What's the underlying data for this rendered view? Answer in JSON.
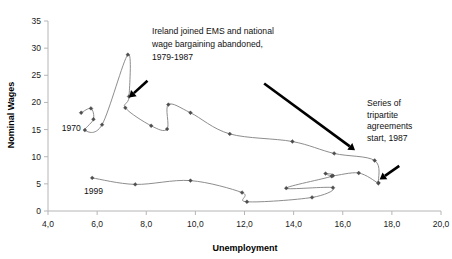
{
  "chart_data": {
    "type": "line",
    "title": "",
    "xlabel": "Unemployment",
    "ylabel": "Nominal Wages",
    "xlim": [
      4.0,
      20.0
    ],
    "ylim": [
      0,
      35
    ],
    "xticks": [
      "4,0",
      "6,0",
      "8,0",
      "10,0",
      "12,0",
      "14,0",
      "16,0",
      "18,0",
      "20,0"
    ],
    "xtick_values": [
      4.0,
      6.0,
      8.0,
      10.0,
      12.0,
      14.0,
      16.0,
      18.0,
      20.0
    ],
    "yticks": [
      "0",
      "5",
      "10",
      "15",
      "20",
      "25",
      "30",
      "35"
    ],
    "ytick_values": [
      0,
      5,
      10,
      15,
      20,
      25,
      30,
      35
    ],
    "grid": false,
    "legend": "none",
    "series": [
      {
        "name": "upper-path-1970-1987",
        "points": [
          [
            5.35,
            18.1
          ],
          [
            5.75,
            18.9
          ],
          [
            5.85,
            16.9
          ],
          [
            5.5,
            14.9
          ],
          [
            6.2,
            15.9
          ],
          [
            7.25,
            28.8
          ],
          [
            7.3,
            21.1
          ],
          [
            7.15,
            19.0
          ],
          [
            8.2,
            15.7
          ],
          [
            8.85,
            15.1
          ],
          [
            8.9,
            19.6
          ],
          [
            9.8,
            18.1
          ],
          [
            11.4,
            14.2
          ],
          [
            13.95,
            12.8
          ],
          [
            15.65,
            10.6
          ],
          [
            17.3,
            9.3
          ],
          [
            17.45,
            5.2
          ]
        ]
      },
      {
        "name": "lower-path-1987-1999",
        "points": [
          [
            17.45,
            5.1
          ],
          [
            16.65,
            7.0
          ],
          [
            15.6,
            6.5
          ],
          [
            15.3,
            6.9
          ],
          [
            15.55,
            6.4
          ],
          [
            13.7,
            4.2
          ],
          [
            15.6,
            4.3
          ],
          [
            14.75,
            2.5
          ],
          [
            12.1,
            1.7
          ],
          [
            11.9,
            3.4
          ],
          [
            9.8,
            5.6
          ],
          [
            7.55,
            4.9
          ],
          [
            5.8,
            6.1
          ]
        ]
      }
    ],
    "annotations": [
      {
        "id": "ems-note",
        "lines": [
          "Ireland joined EMS and national",
          "wage bargaining abandoned,",
          "1979-1987"
        ],
        "arrow_from": [
          8.05,
          24.0
        ],
        "arrow_to": [
          7.3,
          20.9
        ]
      },
      {
        "id": "tripartite-note",
        "lines": [
          "Series of",
          "tripartite",
          "agreements",
          "start, 1987"
        ],
        "arrow_from": [
          12.8,
          23.5
        ],
        "arrow_to": [
          16.5,
          11.2
        ]
      },
      {
        "id": "tripartite-short-arrow",
        "lines": [],
        "arrow_from": [
          18.3,
          8.3
        ],
        "arrow_to": [
          17.5,
          5.8
        ]
      }
    ],
    "point_labels": [
      {
        "text": "1970",
        "x": 4.95,
        "y": 15.2
      },
      {
        "text": "1999",
        "x": 5.85,
        "y": 3.6
      }
    ]
  },
  "colors": {
    "series_line": "#808080",
    "marker": "#4d4d4d",
    "axis": "#b6b6b6",
    "text": "#111111",
    "arrow": "#000000",
    "background": "#ffffff"
  }
}
